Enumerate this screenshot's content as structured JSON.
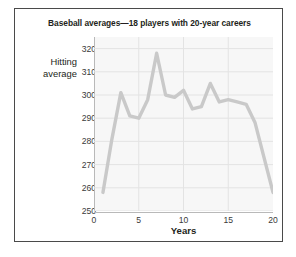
{
  "figure": {
    "title": "Baseball averages—18 players with 20-year careers",
    "border_color": "#4a4a4a",
    "background": "#ffffff"
  },
  "axes": {
    "y_title_line1": "Hitting",
    "y_title_line2": "average",
    "x_title": "Years",
    "y_ticks": [
      "250",
      "260",
      "270",
      "280",
      "290",
      "300",
      "310",
      "320"
    ],
    "x_ticks": [
      "0",
      "5",
      "10",
      "15",
      "20"
    ]
  },
  "chart_data": {
    "type": "line",
    "title": "Baseball averages—18 players with 20-year careers",
    "xlabel": "Years",
    "ylabel": "Hitting average",
    "xlim": [
      0,
      20
    ],
    "ylim": [
      250,
      325
    ],
    "grid": true,
    "legend": false,
    "line_color": "#c9c9c9",
    "plot_background": "#f7f7f7",
    "grid_color": "#e3e3e3",
    "y_gridlines": [
      250,
      260,
      270,
      280,
      290,
      300,
      310,
      320
    ],
    "x_gridlines": [
      5,
      10,
      15
    ],
    "series": [
      {
        "name": "Mean hitting average",
        "x": [
          1,
          2,
          3,
          4,
          5,
          6,
          7,
          8,
          9,
          10,
          11,
          12,
          13,
          14,
          15,
          16,
          17,
          18,
          19,
          20
        ],
        "values": [
          258,
          281,
          301,
          291,
          290,
          298,
          318,
          300,
          299,
          302,
          294,
          295,
          305,
          297,
          298,
          297,
          296,
          288,
          273,
          258
        ]
      }
    ]
  }
}
